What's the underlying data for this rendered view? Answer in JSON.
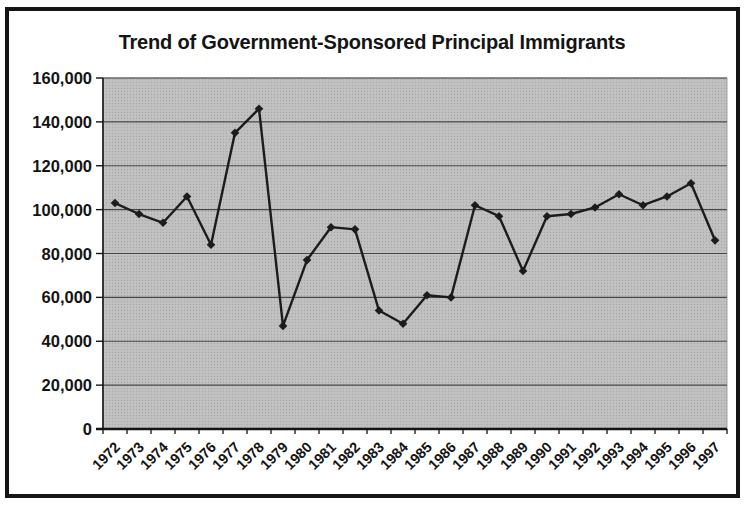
{
  "title": "Trend of Government-Sponsored Principal Immigrants",
  "chart_data": {
    "type": "line",
    "title": "Trend of Government-Sponsored Principal Immigrants",
    "categories": [
      "1972",
      "1973",
      "1974",
      "1975",
      "1976",
      "1977",
      "1978",
      "1979",
      "1980",
      "1981",
      "1982",
      "1983",
      "1984",
      "1985",
      "1986",
      "1987",
      "1988",
      "1989",
      "1990",
      "1991",
      "1992",
      "1993",
      "1994",
      "1995",
      "1996",
      "1997"
    ],
    "values": [
      103000,
      98000,
      94000,
      106000,
      84000,
      135000,
      146000,
      47000,
      77000,
      92000,
      91000,
      54000,
      48000,
      61000,
      60000,
      102000,
      97000,
      72000,
      97000,
      98000,
      101000,
      107000,
      102000,
      106000,
      112000,
      86000
    ],
    "xlabel": "",
    "ylabel": "",
    "ylim": [
      0,
      160000
    ],
    "ytick_interval": 20000,
    "ytick_labels": [
      "0",
      "20,000",
      "40,000",
      "60,000",
      "80,000",
      "100,000",
      "120,000",
      "140,000",
      "160,000"
    ],
    "grid": true,
    "legend": "none",
    "marker": "diamond",
    "colors": {
      "line": "#1c1c1c",
      "marker": "#1c1c1c",
      "plot_bg": "#c1c1c1",
      "plot_bg_dot": "#a9a9a9",
      "gridline": "#4a4a4a",
      "axis": "#141414",
      "label": "#141414",
      "frame": "#141414",
      "page_bg": "#ffffff"
    }
  }
}
